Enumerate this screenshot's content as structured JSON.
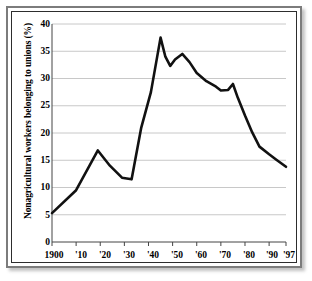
{
  "figure": {
    "frame_style": "double-bevel-border",
    "background_color": "#ffffff",
    "line_color": "#111111",
    "grid_color": "#c8c8c8",
    "axis_color": "#444444"
  },
  "chart_data": {
    "type": "line",
    "title": "",
    "xlabel": "",
    "ylabel": "Nonagricultural workers belonging to unions (%)",
    "xlim": [
      1900,
      1997
    ],
    "ylim": [
      0,
      40
    ],
    "grid": true,
    "legend": "none",
    "y_ticks": [
      0,
      5,
      10,
      15,
      20,
      25,
      30,
      35,
      40
    ],
    "y_tick_labels": [
      "0",
      "5",
      "10",
      "15",
      "20",
      "25",
      "30",
      "35",
      "40"
    ],
    "x_ticks": [
      1900,
      1910,
      1920,
      1930,
      1940,
      1950,
      1960,
      1970,
      1980,
      1990,
      1997
    ],
    "x_tick_labels": [
      "1900",
      "'10",
      "'20",
      "'30",
      "'40",
      "'50",
      "'60",
      "'70",
      "'80",
      "'90",
      "'97"
    ],
    "series": [
      {
        "name": "Union membership share",
        "x": [
          1900,
          1910,
          1919,
          1924,
          1929,
          1933,
          1937,
          1941,
          1945,
          1947,
          1949,
          1951,
          1954,
          1957,
          1960,
          1964,
          1968,
          1970,
          1973,
          1975,
          1977,
          1980,
          1983,
          1986,
          1990,
          1993,
          1997
        ],
        "values": [
          5.3,
          9.5,
          16.8,
          14.0,
          11.8,
          11.5,
          21.0,
          27.5,
          37.5,
          34.0,
          32.3,
          33.5,
          34.5,
          33.0,
          31.0,
          29.5,
          28.5,
          27.8,
          27.9,
          29.0,
          26.5,
          23.2,
          20.1,
          17.5,
          16.1,
          15.1,
          13.8
        ]
      }
    ]
  }
}
